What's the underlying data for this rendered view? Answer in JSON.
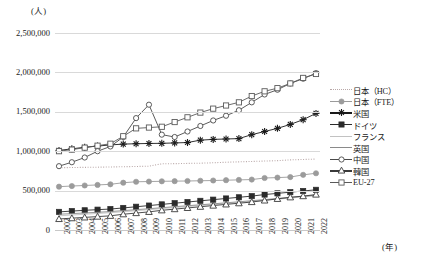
{
  "chart_data": {
    "type": "line",
    "title": "",
    "xlabel": "(年)",
    "ylabel": "(人)",
    "ylim": [
      0,
      2500000
    ],
    "ytick_labels": [
      "2,500,000",
      "2,000,000",
      "1,500,000",
      "1,000,000",
      "500,000",
      "0"
    ],
    "ytick_values": [
      2500000,
      2000000,
      1500000,
      1000000,
      500000,
      0
    ],
    "grid": true,
    "legend_position": "right",
    "x": [
      2002,
      2003,
      2004,
      2005,
      2006,
      2007,
      2008,
      2009,
      2010,
      2011,
      2012,
      2013,
      2014,
      2015,
      2016,
      2017,
      2018,
      2019,
      2020,
      2021,
      2022
    ],
    "categories": [
      "2002",
      "2003",
      "2004",
      "2005",
      "2006",
      "2007",
      "2008",
      "2009",
      "2010",
      "2011",
      "2012",
      "2013",
      "2014",
      "2015",
      "2016",
      "2017",
      "2018",
      "2019",
      "2020",
      "2021",
      "2022"
    ],
    "series": [
      {
        "name": "日本（HC）",
        "marker": "none",
        "line": "dotted",
        "color": "#b9a8a8",
        "values": [
          790000,
          793000,
          795000,
          797000,
          800000,
          803000,
          806000,
          810000,
          840000,
          842000,
          845000,
          848000,
          853000,
          860000,
          865000,
          870000,
          875000,
          880000,
          890000,
          895000,
          900000
        ]
      },
      {
        "name": "日本（FTE）",
        "marker": "circle-filled",
        "line": "solid",
        "color": "#9b9b9b",
        "values": [
          550000,
          558000,
          565000,
          572000,
          580000,
          600000,
          612000,
          615000,
          618000,
          620000,
          622000,
          625000,
          628000,
          632000,
          636000,
          640000,
          660000,
          665000,
          672000,
          700000,
          720000
        ]
      },
      {
        "name": "米国",
        "marker": "star",
        "line": "solid",
        "color": "#1a1a1a",
        "values": [
          1010000,
          1030000,
          1050000,
          1065000,
          1080000,
          1090000,
          1095000,
          1098000,
          1100000,
          1105000,
          1110000,
          1140000,
          1150000,
          1155000,
          1160000,
          1210000,
          1250000,
          1290000,
          1340000,
          1400000,
          1480000
        ]
      },
      {
        "name": "ドイツ",
        "marker": "square-filled",
        "line": "solid",
        "color": "#2b2b2b",
        "values": [
          null,
          null,
          null,
          null,
          null,
          null,
          null,
          null,
          null,
          null,
          null,
          null,
          null,
          null,
          null,
          null,
          null,
          null,
          null,
          null,
          null
        ]
      },
      {
        "name": "フランス",
        "marker": "none",
        "line": "solid",
        "color": "#c2c2c2",
        "values": [
          null,
          null,
          null,
          null,
          null,
          null,
          null,
          null,
          null,
          null,
          null,
          null,
          null,
          null,
          null,
          null,
          null,
          null,
          null,
          null,
          null
        ]
      },
      {
        "name": "英国",
        "marker": "none",
        "line": "solid",
        "color": "#8a8a8a",
        "values": [
          null,
          null,
          null,
          null,
          null,
          null,
          null,
          null,
          null,
          null,
          null,
          null,
          null,
          null,
          null,
          null,
          null,
          null,
          null,
          null,
          null
        ]
      },
      {
        "name": "中国",
        "marker": "circle-open",
        "line": "solid",
        "color": "#4a4a4a",
        "values": [
          810000,
          860000,
          920000,
          1000000,
          1060000,
          1180000,
          1420000,
          1590000,
          1210000,
          1180000,
          1250000,
          1320000,
          1390000,
          1450000,
          1520000,
          1620000,
          1720000,
          1780000,
          1860000,
          1920000,
          1990000
        ]
      },
      {
        "name": "韓国",
        "marker": "triangle-open",
        "line": "solid",
        "color": "#3a3a3a",
        "values": [
          140000,
          150000,
          160000,
          170000,
          180000,
          200000,
          215000,
          230000,
          250000,
          265000,
          280000,
          295000,
          310000,
          325000,
          340000,
          355000,
          375000,
          395000,
          415000,
          430000,
          450000
        ]
      },
      {
        "name": "EU-27",
        "marker": "square-open",
        "line": "solid",
        "color": "#5a5a5a",
        "values": [
          1000000,
          1020000,
          1045000,
          1070000,
          1095000,
          1190000,
          1290000,
          1300000,
          1310000,
          1370000,
          1430000,
          1490000,
          1540000,
          1580000,
          1620000,
          1700000,
          1760000,
          1800000,
          1860000,
          1930000,
          1980000
        ]
      }
    ],
    "series_germany_dense": {
      "name": "ドイツ",
      "values": [
        230000,
        240000,
        250000,
        258000,
        266000,
        280000,
        295000,
        310000,
        325000,
        340000,
        355000,
        370000,
        385000,
        400000,
        415000,
        430000,
        450000,
        465000,
        480000,
        495000,
        510000
      ]
    },
    "series_france_dense": {
      "name": "フランス",
      "values": [
        180000,
        190000,
        200000,
        210000,
        220000,
        232000,
        245000,
        258000,
        272000,
        285000,
        298000,
        310000,
        322000,
        335000,
        348000,
        362000,
        378000,
        392000,
        405000,
        420000,
        435000
      ]
    },
    "series_uk_dense": {
      "name": "英国",
      "values": [
        200000,
        208000,
        216000,
        225000,
        234000,
        246000,
        258000,
        270000,
        283000,
        296000,
        308000,
        320000,
        332000,
        345000,
        358000,
        372000,
        386000,
        400000,
        414000,
        428000,
        442000
      ]
    }
  },
  "legend": {
    "items": [
      {
        "label": "日本（HC）",
        "key": "hc"
      },
      {
        "label": "日本（FTE）",
        "key": "fte"
      },
      {
        "label": "米国",
        "key": "us"
      },
      {
        "label": "ドイツ",
        "key": "de"
      },
      {
        "label": "フランス",
        "key": "fr"
      },
      {
        "label": "英国",
        "key": "uk"
      },
      {
        "label": "中国",
        "key": "cn"
      },
      {
        "label": "韓国",
        "key": "kr"
      },
      {
        "label": "EU-27",
        "key": "eu"
      }
    ]
  }
}
